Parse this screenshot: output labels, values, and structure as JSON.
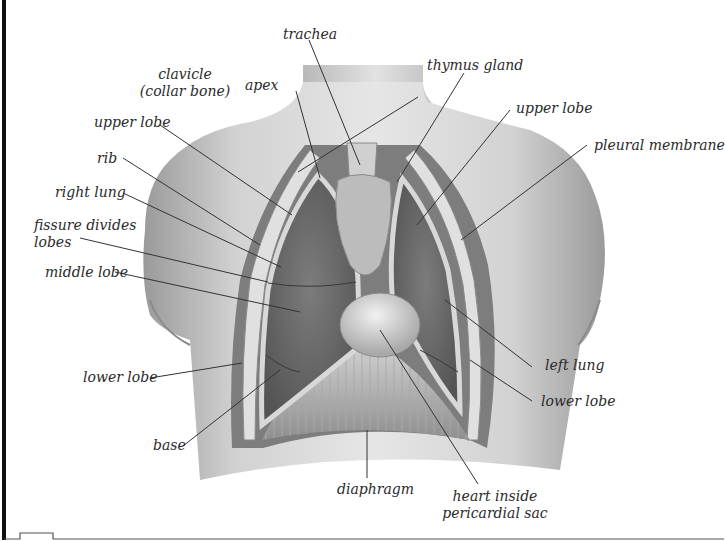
{
  "diagram": {
    "labels": {
      "trachea": "trachea",
      "thymus_gland": "thymus gland",
      "clavicle_line1": "clavicle",
      "clavicle_line2": "(collar bone)",
      "apex": "apex",
      "upper_lobe_right": "upper lobe",
      "upper_lobe_left": "upper lobe",
      "pleural_membrane": "pleural membrane",
      "rib": "rib",
      "right_lung": "right lung",
      "fissure_line1": "fissure divides",
      "fissure_line2": "lobes",
      "middle_lobe": "middle lobe",
      "lower_lobe_right": "lower lobe",
      "left_lung": "left lung",
      "lower_lobe_left": "lower lobe",
      "base": "base",
      "diaphragm": "diaphragm",
      "heart_line1": "heart inside",
      "heart_line2": "pericardial sac"
    },
    "colors": {
      "skin": "#c8c8c8",
      "lung": "#6e6e6e",
      "pleura": "#e4e4e4",
      "leader_line": "#333333",
      "frame": "#111111"
    }
  }
}
